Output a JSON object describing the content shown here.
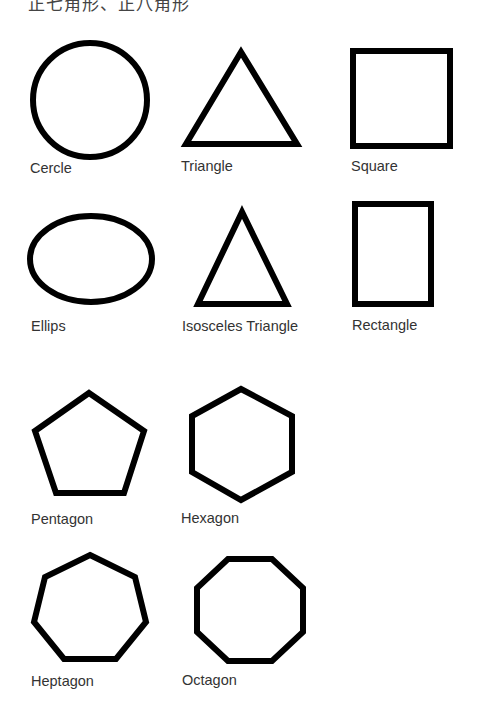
{
  "title": "正七角形、正八角形",
  "stroke_color": "#000000",
  "label_color": "#333333",
  "shapes": [
    {
      "name": "Cercle",
      "label": "Cercle"
    },
    {
      "name": "Triangle",
      "label": "Triangle"
    },
    {
      "name": "Square",
      "label": "Square"
    },
    {
      "name": "Ellipse",
      "label": "Ellips"
    },
    {
      "name": "Isosceles Triangle",
      "label": "Isosceles Triangle"
    },
    {
      "name": "Rectangle",
      "label": "Rectangle"
    },
    {
      "name": "Pentagon",
      "label": "Pentagon"
    },
    {
      "name": "Hexagon",
      "label": "Hexagon"
    },
    {
      "name": "Heptagon",
      "label": "Heptagon"
    },
    {
      "name": "Octagon",
      "label": "Octagon"
    }
  ]
}
